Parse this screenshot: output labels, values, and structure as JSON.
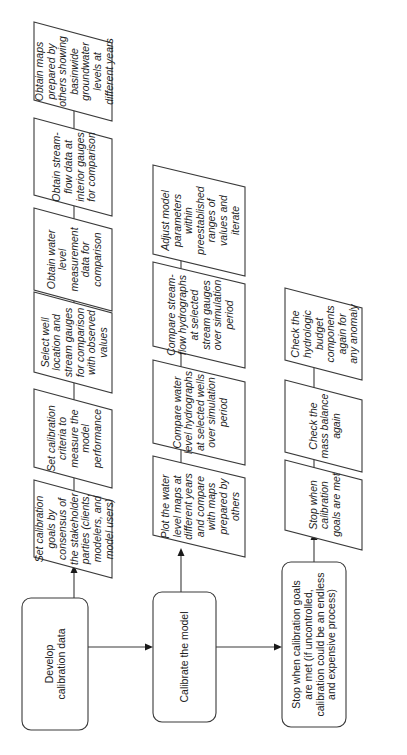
{
  "diagram": {
    "orientation": "rotated-90-ccw",
    "colors": {
      "stroke": "#3a3a3a",
      "text": "#222222",
      "background": "#ffffff"
    },
    "main_flow": [
      {
        "id": "develop",
        "shape": "rounded-rect",
        "lines": [
          "Develop",
          "calibration data"
        ]
      },
      {
        "id": "calibrate",
        "shape": "rounded-rect",
        "lines": [
          "Calibrate the model"
        ]
      },
      {
        "id": "stop_main",
        "shape": "rounded-rect",
        "lines": [
          "Stop when calibration goals",
          "are met (if uncontrolled,",
          "calibration could be an endless",
          "and expensive process)"
        ]
      }
    ],
    "develop_steps": [
      {
        "lines": [
          "Set calibration",
          "goals by",
          "consensus of",
          "the stakeholder",
          "parties (clients,",
          "modelers, and",
          "model users)"
        ]
      },
      {
        "lines": [
          "Set calibration",
          "criteria to",
          "measure the",
          "model",
          "performance"
        ]
      },
      {
        "lines": [
          "Select well",
          "location and",
          "stream gauges",
          "for comparison",
          "with observed",
          "values"
        ]
      },
      {
        "lines": [
          "Obtain water",
          "level",
          "measurement",
          "data for",
          "comparison"
        ]
      },
      {
        "lines": [
          "Obtain stream-",
          "flow data at",
          "interior gauges",
          "for comparison"
        ]
      },
      {
        "lines": [
          "Obtain maps",
          "prepared by",
          "others showing",
          "basinwide",
          "groundwater",
          "levels at",
          "different years"
        ]
      }
    ],
    "calibrate_steps": [
      {
        "lines": [
          "Plot the water",
          "level maps at",
          "different years",
          "and compare",
          "with maps",
          "prepared by",
          "others"
        ]
      },
      {
        "lines": [
          "Compare water",
          "level hydrographs",
          "at selected wells",
          "over simulation",
          "period"
        ]
      },
      {
        "lines": [
          "Compare stream-",
          "flow hydrographs",
          "at selected",
          "stream gauges",
          "over simulation",
          "period"
        ]
      },
      {
        "lines": [
          "Adjust model",
          "parameters",
          "within",
          "preestablished",
          "ranges of",
          "values and",
          "iterate"
        ]
      }
    ],
    "stop_steps": [
      {
        "lines": [
          "Stop when",
          "calibration",
          "goals are met"
        ]
      },
      {
        "lines": [
          "Check the",
          "mass balance",
          "again"
        ]
      },
      {
        "lines": [
          "Check the",
          "hydrologic",
          "budget",
          "components",
          "again for",
          "any anomaly"
        ]
      }
    ]
  }
}
